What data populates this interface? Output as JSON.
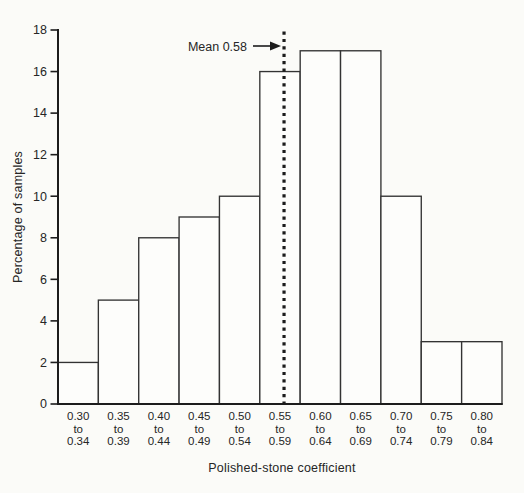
{
  "chart_data": {
    "type": "bar",
    "title": "",
    "xlabel": "Polished-stone coefficient",
    "ylabel": "Percentage of samples",
    "ylim": [
      0,
      18
    ],
    "yticks": [
      0,
      2,
      4,
      6,
      8,
      10,
      12,
      14,
      16,
      18
    ],
    "grid": false,
    "legend": "none",
    "categories": [
      "0.30 to 0.34",
      "0.35 to 0.39",
      "0.40 to 0.44",
      "0.45 to 0.49",
      "0.50 to 0.54",
      "0.55 to 0.59",
      "0.60 to 0.64",
      "0.65 to 0.69",
      "0.70 to 0.74",
      "0.75 to 0.79",
      "0.80 to 0.84"
    ],
    "bins": [
      {
        "low": "0.30",
        "high": "0.34"
      },
      {
        "low": "0.35",
        "high": "0.39"
      },
      {
        "low": "0.40",
        "high": "0.44"
      },
      {
        "low": "0.45",
        "high": "0.49"
      },
      {
        "low": "0.50",
        "high": "0.54"
      },
      {
        "low": "0.55",
        "high": "0.59"
      },
      {
        "low": "0.60",
        "high": "0.64"
      },
      {
        "low": "0.65",
        "high": "0.69"
      },
      {
        "low": "0.70",
        "high": "0.74"
      },
      {
        "low": "0.75",
        "high": "0.79"
      },
      {
        "low": "0.80",
        "high": "0.84"
      }
    ],
    "range_word": "to",
    "values": [
      2,
      5,
      8,
      9,
      10,
      16,
      17,
      17,
      10,
      3,
      3
    ],
    "bin_start": 0.3,
    "bin_width": 0.05,
    "mean": 0.58,
    "mean_label": "Mean 0.58",
    "colors": {
      "line": "#1c1c1c",
      "bar_stroke": "#333333",
      "bar_fill": "#fdfdfb",
      "text": "#262626",
      "background": "#fbfbf8"
    }
  }
}
